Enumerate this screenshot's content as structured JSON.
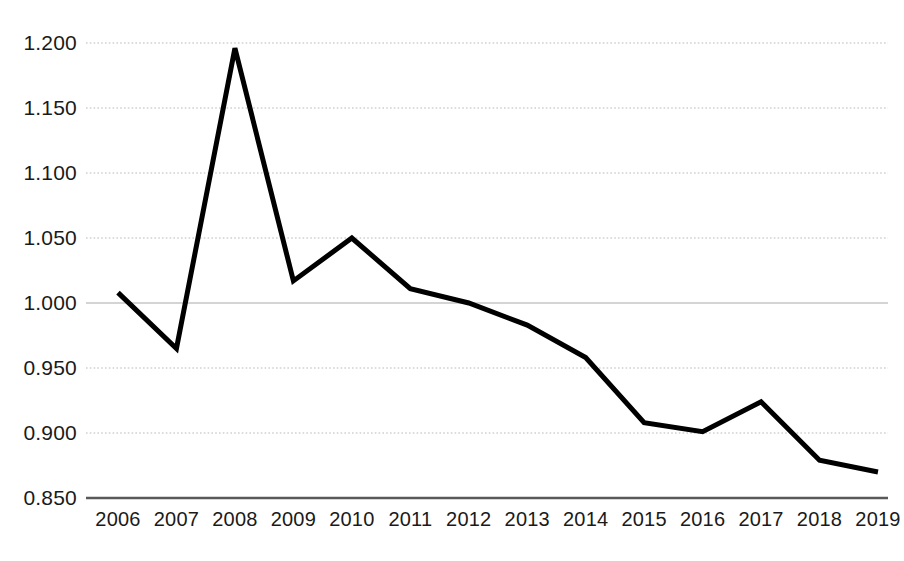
{
  "chart_data": {
    "type": "line",
    "title": "",
    "subtitle": "",
    "xlabel": "",
    "ylabel": "",
    "categories": [
      "2006",
      "2007",
      "2008",
      "2009",
      "2010",
      "2011",
      "2012",
      "2013",
      "2014",
      "2015",
      "2016",
      "2017",
      "2018",
      "2019"
    ],
    "values": [
      1.008,
      0.965,
      1.196,
      1.017,
      1.05,
      1.011,
      1.0,
      0.983,
      0.958,
      0.908,
      0.901,
      0.924,
      0.879,
      0.87
    ],
    "series": [
      {
        "name": "",
        "values": [
          1.008,
          0.965,
          1.196,
          1.017,
          1.05,
          1.011,
          1.0,
          0.983,
          0.958,
          0.908,
          0.901,
          0.924,
          0.879,
          0.87
        ]
      }
    ],
    "ylim": [
      0.85,
      1.2
    ],
    "y_ticks": [
      0.85,
      0.9,
      0.95,
      1.0,
      1.05,
      1.1,
      1.15,
      1.2
    ],
    "y_tick_labels": [
      "0.850",
      "0.900",
      "0.950",
      "1.000",
      "1.050",
      "1.100",
      "1.150",
      "1.200"
    ],
    "x_tick_labels": [
      "2006",
      "2007",
      "2008",
      "2009",
      "2010",
      "2011",
      "2012",
      "2013",
      "2014",
      "2015",
      "2016",
      "2017",
      "2018",
      "2019"
    ],
    "grid": true,
    "grid_style": "dotted",
    "legend": "none",
    "annotations": [],
    "colors": {
      "line": "#000000",
      "grid": "#b3b3b3",
      "axis": "#595959",
      "background": "#ffffff",
      "text": "#1a1a1a"
    },
    "line_width": 5,
    "decimal_separator": "."
  }
}
